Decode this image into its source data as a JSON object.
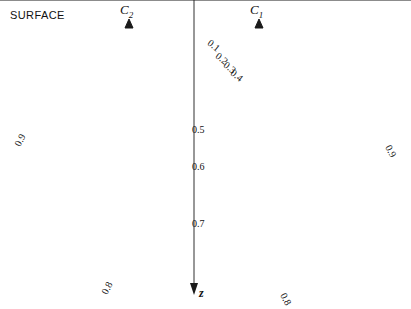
{
  "figure": {
    "surface_label": "SURFACE",
    "depth_axis_label": "z",
    "electrodes": [
      {
        "name": "C2",
        "letter": "C",
        "sub": "2",
        "x": 129,
        "y": 22
      },
      {
        "name": "C1",
        "letter": "C",
        "sub": "1",
        "x": 259,
        "y": 22
      }
    ],
    "fraction_labels": [
      {
        "text": "0.1",
        "x": 209,
        "y": 36,
        "rot": 38
      },
      {
        "text": "0.2",
        "x": 217,
        "y": 49,
        "rot": 38
      },
      {
        "text": "0.3",
        "x": 225,
        "y": 58,
        "rot": 38
      },
      {
        "text": "0.4",
        "x": 232,
        "y": 66,
        "rot": 38
      },
      {
        "text": "0.5",
        "x": 192,
        "y": 124,
        "rot": 0
      },
      {
        "text": "0.6",
        "x": 192,
        "y": 161,
        "rot": 0
      },
      {
        "text": "0.7",
        "x": 192,
        "y": 218,
        "rot": 0
      },
      {
        "text": "0.8",
        "x": 104,
        "y": 288,
        "rot": -62
      },
      {
        "text": "0.8",
        "x": 283,
        "y": 288,
        "rot": 62
      },
      {
        "text": "0.9",
        "x": 17,
        "y": 140,
        "rot": -62
      },
      {
        "text": "0.9",
        "x": 388,
        "y": 140,
        "rot": 62
      }
    ]
  },
  "chart_data": {
    "type": "line",
    "xlabel": "",
    "ylabel": "z",
    "grid": false,
    "legend": "none",
    "surface_y": 22,
    "electrode_separation": 130,
    "current_fraction_contours": [
      0.1,
      0.2,
      0.3,
      0.4,
      0.5,
      0.6,
      0.7,
      0.8,
      0.9
    ],
    "flow_line_count": 36,
    "equipotential_count": 15,
    "annotations": [
      "SURFACE",
      "C2",
      "C1",
      "z"
    ]
  },
  "style": {
    "line_color": "#1a1a1a",
    "background": "#ffffff"
  }
}
